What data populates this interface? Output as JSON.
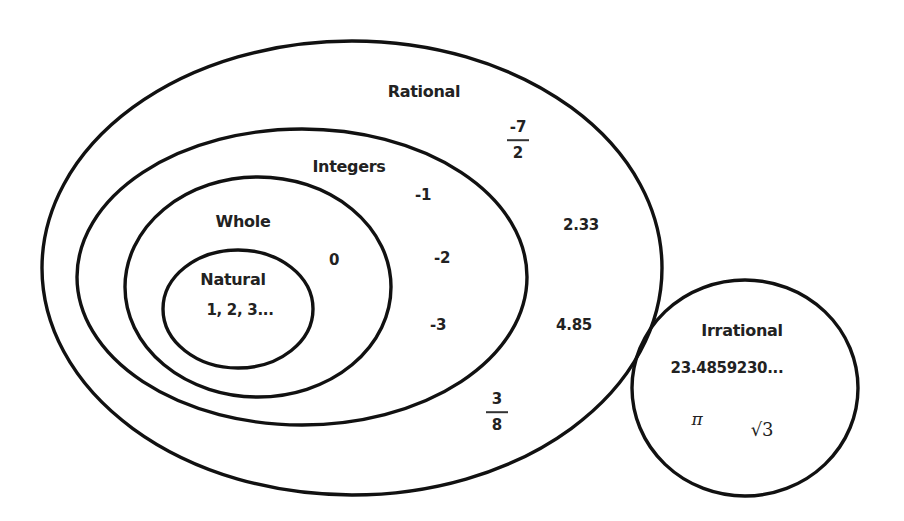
{
  "sets": [
    {
      "id": "rational",
      "label": "Rational",
      "members": [
        "-7/2",
        "2.33",
        "4.85",
        "3/8"
      ]
    },
    {
      "id": "integers",
      "label": "Integers",
      "members": [
        "-1",
        "-2",
        "-3"
      ]
    },
    {
      "id": "whole",
      "label": "Whole",
      "members": [
        "0"
      ]
    },
    {
      "id": "natural",
      "label": "Natural",
      "members": [
        "1, 2, 3..."
      ]
    },
    {
      "id": "irrational",
      "label": "Irrational",
      "members": [
        "23.4859230...",
        "π",
        "√3"
      ]
    }
  ],
  "labels": {
    "rational": "Rational",
    "integers": "Integers",
    "whole": "Whole",
    "natural": "Natural",
    "irrational": "Irrational"
  },
  "values": {
    "natural_list": "1, 2, 3...",
    "zero": "0",
    "neg1": "-1",
    "neg2": "-2",
    "neg3": "-3",
    "dec_233": "2.33",
    "dec_485": "4.85",
    "frac_neg7_2": {
      "num": "-7",
      "den": "2"
    },
    "frac_3_8": {
      "num": "3",
      "den": "8"
    },
    "irr_decimal": "23.4859230...",
    "pi": "π",
    "sqrt3": "√3"
  },
  "colors": {
    "stroke": "#111111",
    "text": "#222222",
    "background": "#ffffff"
  }
}
